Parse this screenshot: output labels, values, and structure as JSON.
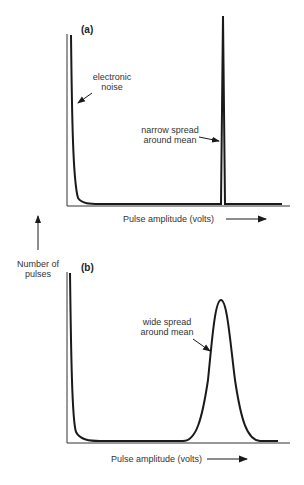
{
  "figure": {
    "y_axis_label_line1": "Number of",
    "y_axis_label_line2": "pulses",
    "panel_a": {
      "tag": "(a)",
      "annotation_noise_line1": "electronic",
      "annotation_noise_line2": "noise",
      "annotation_peak_line1": "narrow spread",
      "annotation_peak_line2": "around mean",
      "x_axis_label": "Pulse amplitude (volts)"
    },
    "panel_b": {
      "tag": "(b)",
      "annotation_peak_line1": "wide spread",
      "annotation_peak_line2": "around mean",
      "x_axis_label": "Pulse amplitude (volts)"
    }
  },
  "colors": {
    "line": "#1a1a1a",
    "text": "#333333"
  }
}
